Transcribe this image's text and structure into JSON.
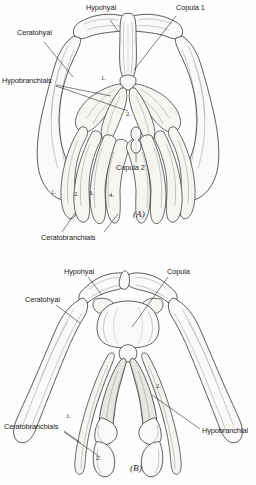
{
  "document": {
    "type": "anatomical-illustration",
    "subject": "Hyobranchial (hyoid and branchial) skeleton, two views",
    "background_color": "#fefefe",
    "ink_color": "#1b1b1b"
  },
  "figures": [
    {
      "id": "A",
      "caption": "(A)",
      "labels": [
        {
          "name": "hypohyal",
          "text": "Hypohyal",
          "x": 86,
          "y": 10
        },
        {
          "name": "copula-1",
          "text": "Copula 1",
          "x": 176,
          "y": 10
        },
        {
          "name": "ceratohyal",
          "text": "Ceratohyal",
          "x": 22,
          "y": 35
        },
        {
          "name": "hypobranchials",
          "text": "Hypobranchials",
          "x": 4,
          "y": 80
        },
        {
          "name": "copula-2",
          "text": "Copula 2",
          "x": 101,
          "y": 167
        },
        {
          "name": "ceratobranchials",
          "text": "Ceratobranchials",
          "x": 41,
          "y": 238
        }
      ],
      "callouts": [
        {
          "name": "hypobranchial-1",
          "text": "1.",
          "x": 101,
          "y": 80
        },
        {
          "name": "hypobranchial-2",
          "text": "2.",
          "x": 126,
          "y": 115
        },
        {
          "name": "ceratobranchial-1",
          "text": "1.",
          "x": 51,
          "y": 192
        },
        {
          "name": "ceratobranchial-2",
          "text": "2.",
          "x": 74,
          "y": 193
        },
        {
          "name": "ceratobranchial-3",
          "text": "3.",
          "x": 88,
          "y": 192
        },
        {
          "name": "ceratobranchial-4",
          "text": "4.",
          "x": 108,
          "y": 194
        }
      ]
    },
    {
      "id": "B",
      "caption": "(B)",
      "labels": [
        {
          "name": "hypohyal",
          "text": "Hypohyal",
          "x": 64,
          "y": 28
        },
        {
          "name": "copula",
          "text": "Copula",
          "x": 167,
          "y": 28
        },
        {
          "name": "ceratohyal",
          "text": "Ceratohyal",
          "x": 31,
          "y": 56
        },
        {
          "name": "hypobranchial",
          "text": "Hypobranchial",
          "x": 202,
          "y": 190
        },
        {
          "name": "ceratobranchials",
          "text": "Ceratobranchials",
          "x": 8,
          "y": 183
        }
      ],
      "callouts": [
        {
          "name": "hypobranchial-2",
          "text": "2.",
          "x": 156,
          "y": 142
        },
        {
          "name": "ceratobranchial-1",
          "text": "1.",
          "x": 66,
          "y": 172
        },
        {
          "name": "ceratobranchial-2",
          "text": "2.",
          "x": 96,
          "y": 214
        }
      ]
    }
  ]
}
